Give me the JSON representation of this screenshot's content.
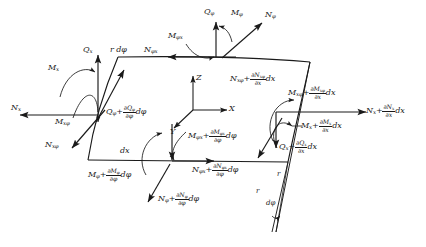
{
  "figure": {
    "domain": "engineering-mechanics",
    "axes": {
      "x": "X",
      "y": "Y",
      "z": "Z"
    },
    "geometry_labels": {
      "arc_length": "r dφ",
      "axial_length": "dx",
      "radius_1": "r",
      "radius_2": "r",
      "subtended_angle": "dφ"
    },
    "labels": {
      "top_q_phi": {
        "base": "Q",
        "sub": "φ"
      },
      "top_m_phi": {
        "base": "M",
        "sub": "φ"
      },
      "top_n_phi": {
        "base": "N",
        "sub": "φ"
      },
      "top_m_phix": {
        "base": "M",
        "sub": "φx"
      },
      "top_n_phix": {
        "base": "N",
        "sub": "φx"
      },
      "left_q_x": {
        "base": "Q",
        "sub": "x"
      },
      "left_m_x": {
        "base": "M",
        "sub": "x"
      },
      "left_n_x": {
        "base": "N",
        "sub": "x"
      },
      "left_m_xphi": {
        "base": "M",
        "sub": "xφ"
      },
      "left_n_xphi": {
        "base": "N",
        "sub": "xφ"
      }
    },
    "incremented": {
      "q_phi": {
        "base": "Q",
        "sub": "φ",
        "num_base": "∂Q",
        "num_sub": "φ",
        "den": "∂φ",
        "diff": "dφ"
      },
      "n_xphi": {
        "base": "N",
        "sub": "xφ",
        "num_base": "∂N",
        "num_sub": "xφ",
        "den": "∂x",
        "diff": "dx"
      },
      "m_xphi": {
        "base": "M",
        "sub": "xφ",
        "num_base": "∂M",
        "num_sub": "xφ",
        "den": "∂x",
        "diff": "dx"
      },
      "n_x": {
        "base": "N",
        "sub": "x",
        "num_base": "∂N",
        "num_sub": "x",
        "den": "∂x",
        "diff": "dx"
      },
      "m_x": {
        "base": "M",
        "sub": "x",
        "num_base": "∂M",
        "num_sub": "x",
        "den": "∂x",
        "diff": "dx"
      },
      "q_x": {
        "base": "Q",
        "sub": "x",
        "num_base": "∂Q",
        "num_sub": "x",
        "den": "∂x",
        "diff": "dx"
      },
      "m_phix": {
        "base": "M",
        "sub": "φx",
        "num_base": "∂M",
        "num_sub": "φx",
        "den": "∂φ",
        "diff": "dφ"
      },
      "n_phix": {
        "base": "N",
        "sub": "φx",
        "num_base": "∂N",
        "num_sub": "φx",
        "den": "∂φ",
        "diff": "dφ"
      },
      "m_phi": {
        "base": "M",
        "sub": "φ",
        "num_base": "∂M",
        "num_sub": "φ",
        "den": "∂φ",
        "diff": "dφ"
      },
      "n_phi": {
        "base": "N",
        "sub": "φ",
        "num_base": "∂N",
        "num_sub": "φ",
        "den": "∂φ",
        "diff": "dφ"
      }
    },
    "symbols": {
      "plus": "+",
      "partial": "∂"
    },
    "colors": {
      "stroke": "#1a1a1a",
      "background": "#ffffff"
    }
  }
}
